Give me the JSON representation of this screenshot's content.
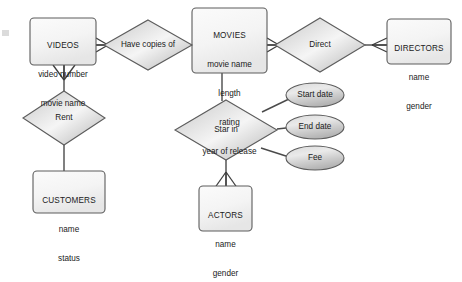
{
  "diagram": {
    "type": "entity-relationship",
    "background_color": "#ffffff",
    "shape_fill_light": "#f2f2f2",
    "shape_fill_dark": "#b8b8b8",
    "stroke_color": "#595959",
    "text_color": "#1a1a1a"
  },
  "entities": [
    {
      "id": "videos",
      "name": "VIDEOS",
      "attributes": [
        "video number",
        "movie name"
      ],
      "x": 30,
      "y": 18,
      "w": 66,
      "h": 47
    },
    {
      "id": "movies",
      "name": "MOVIES",
      "attributes": [
        "movie name",
        "length",
        "rating",
        "year of release"
      ],
      "x": 192,
      "y": 8,
      "w": 75,
      "h": 65
    },
    {
      "id": "directors",
      "name": "DIRECTORS",
      "attributes": [
        "name",
        "gender"
      ],
      "x": 387,
      "y": 19,
      "w": 64,
      "h": 45
    },
    {
      "id": "customers",
      "name": "CUSTOMERS",
      "attributes": [
        "name",
        "status"
      ],
      "x": 33,
      "y": 171,
      "w": 72,
      "h": 42
    },
    {
      "id": "actors",
      "name": "ACTORS",
      "attributes": [
        "name",
        "gender"
      ],
      "x": 199,
      "y": 186,
      "w": 53,
      "h": 45
    }
  ],
  "relationships": [
    {
      "id": "have-copies-of",
      "label": "Have copies of",
      "cx": 148,
      "cy": 45,
      "rx": 44,
      "ry": 25
    },
    {
      "id": "direct",
      "label": "Direct",
      "cx": 320,
      "cy": 45,
      "rx": 45,
      "ry": 27
    },
    {
      "id": "rent",
      "label": "Rent",
      "cx": 64,
      "cy": 118,
      "rx": 41,
      "ry": 27
    },
    {
      "id": "star-in",
      "label": "Star in",
      "cx": 226,
      "cy": 130,
      "rx": 51,
      "ry": 30
    }
  ],
  "attribute_ellipses": [
    {
      "id": "start-date",
      "label": "Start date",
      "cx": 315,
      "cy": 95,
      "rx": 29,
      "ry": 12
    },
    {
      "id": "end-date",
      "label": "End date",
      "cx": 315,
      "cy": 127,
      "rx": 29,
      "ry": 12
    },
    {
      "id": "fee",
      "label": "Fee",
      "cx": 315,
      "cy": 158,
      "rx": 29,
      "ry": 12
    }
  ],
  "connections": [
    {
      "id": "videos-have-copies-of",
      "from": "videos",
      "to": "have-copies-of",
      "crowsfoot_at": "videos"
    },
    {
      "id": "have-copies-of-movies",
      "from": "have-copies-of",
      "to": "movies",
      "crowsfoot_at": "none"
    },
    {
      "id": "movies-direct",
      "from": "movies",
      "to": "direct",
      "crowsfoot_at": "movies"
    },
    {
      "id": "direct-directors",
      "from": "direct",
      "to": "directors",
      "crowsfoot_at": "directors"
    },
    {
      "id": "videos-rent",
      "from": "videos",
      "to": "rent",
      "crowsfoot_at": "videos"
    },
    {
      "id": "rent-customers",
      "from": "rent",
      "to": "customers",
      "crowsfoot_at": "none"
    },
    {
      "id": "movies-star-in",
      "from": "movies",
      "to": "star-in",
      "crowsfoot_at": "none"
    },
    {
      "id": "star-in-actors",
      "from": "star-in",
      "to": "actors",
      "crowsfoot_at": "star-in"
    },
    {
      "id": "star-in-start-date",
      "from": "star-in",
      "to": "start-date",
      "crowsfoot_at": "none"
    },
    {
      "id": "star-in-end-date",
      "from": "star-in",
      "to": "end-date",
      "crowsfoot_at": "none"
    },
    {
      "id": "star-in-fee",
      "from": "star-in",
      "to": "fee",
      "crowsfoot_at": "none"
    }
  ]
}
